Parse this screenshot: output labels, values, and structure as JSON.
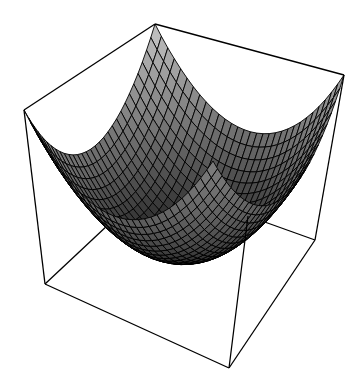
{
  "chart_data": {
    "type": "surface3d",
    "title": "",
    "function": "z = x^2 + y^2",
    "xlabel": "",
    "ylabel": "",
    "zlabel": "",
    "xlim": [
      -1,
      1
    ],
    "ylim": [
      -1,
      1
    ],
    "zlim": [
      0,
      2
    ],
    "grid_resolution": 30,
    "shading": "grayscale",
    "ticks": false,
    "box": true,
    "colors": {
      "background": "#ffffff",
      "mesh_line": "#000000",
      "box_line": "#000000",
      "surface_light": "#d8d8d8",
      "surface_dark": "#000000"
    },
    "box_vertices_screen": {
      "top_left": [
        24,
        110
      ],
      "top_back": [
        155,
        24
      ],
      "top_right": [
        344,
        75
      ],
      "bottom_left": [
        45,
        284
      ],
      "bottom_front": [
        229,
        368
      ],
      "bottom_right": [
        315,
        240
      ],
      "inner_front_top": [
        248,
        216
      ],
      "inner_back_bottom_visible": [
        125,
        209
      ]
    },
    "surface_min_screen": [
      186,
      257
    ]
  }
}
